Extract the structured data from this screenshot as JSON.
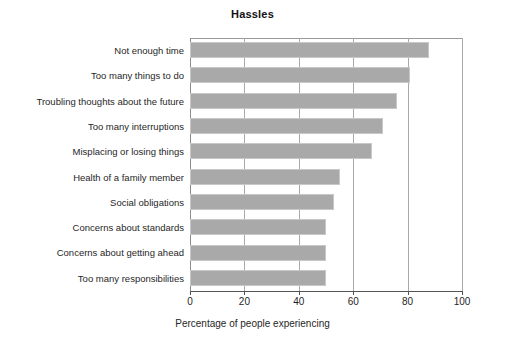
{
  "chart_data": {
    "type": "bar",
    "orientation": "horizontal",
    "title": "Hassles",
    "xlabel": "Percentage of people experiencing",
    "ylabel": "",
    "xlim": [
      0,
      100
    ],
    "xticks": [
      0,
      20,
      40,
      60,
      80,
      100
    ],
    "xtick_labels": [
      "0",
      "20",
      "40",
      "60",
      "80",
      "100"
    ],
    "grid": true,
    "grid_axis": "x",
    "legend": false,
    "bar_color": "#a9a9a9",
    "bar_edge_color": "#c8c8c8",
    "categories": [
      "Not enough time",
      "Too many things to do",
      "Troubling thoughts about the future",
      "Too many interruptions",
      "Misplacing or losing things",
      "Health of a family member",
      "Social obligations",
      "Concerns about standards",
      "Concerns about getting ahead",
      "Too many responsibilities"
    ],
    "values": [
      88,
      81,
      76,
      71,
      67,
      55,
      53,
      50,
      50,
      50
    ]
  }
}
